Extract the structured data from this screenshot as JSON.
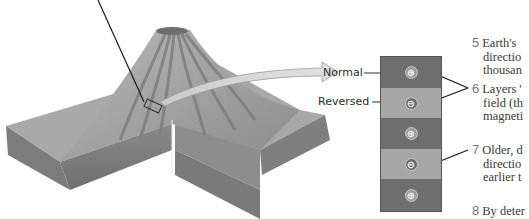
{
  "diagram": {
    "column": {
      "bands": [
        {
          "polarity": "normal",
          "symbol": "⊕",
          "color": "#6e6e6e"
        },
        {
          "polarity": "reversed",
          "symbol": "⊖",
          "color": "#a7a7a7"
        },
        {
          "polarity": "normal",
          "symbol": "⊕",
          "color": "#6e6e6e"
        },
        {
          "polarity": "reversed",
          "symbol": "⊖",
          "color": "#a7a7a7"
        },
        {
          "polarity": "normal",
          "symbol": "⊕",
          "color": "#6e6e6e"
        }
      ]
    },
    "labels": {
      "normal": "Normal",
      "reversed": "Reversed"
    },
    "steps": [
      {
        "num": "5",
        "lines": [
          "Earth's",
          "directio",
          "thousan"
        ]
      },
      {
        "num": "6",
        "lines": [
          "Layers '",
          "field (th",
          "magneti"
        ]
      },
      {
        "num": "7",
        "lines": [
          "Older, d",
          "directio",
          "earlier t"
        ]
      },
      {
        "num": "8",
        "lines": [
          "By deter"
        ]
      }
    ],
    "colors": {
      "normal_band": "#6e6e6e",
      "reversed_band": "#a7a7a7",
      "leader_line": "#1a1a1a",
      "step_number": "#777777"
    }
  }
}
